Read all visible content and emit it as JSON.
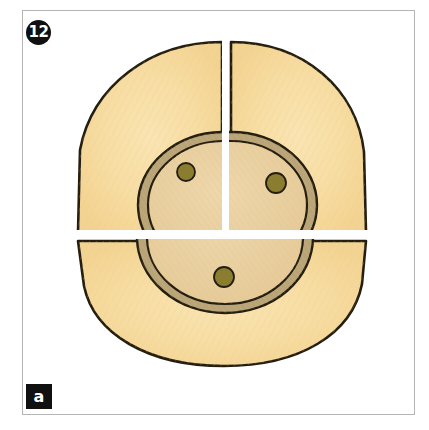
{
  "figure": {
    "panel_number": "12",
    "panel_letter": "a",
    "frame": {
      "x": 22,
      "y": 10,
      "width": 393,
      "height": 405,
      "border_color": "#b5b5b5"
    },
    "background_color": "#ffffff"
  },
  "palette": {
    "outer_cortex_fill": "#f7dda2",
    "inner_core_fill": "#e9cfa0",
    "ring_band_fill": "#b9a477",
    "dot_fill": "#8b7d2f",
    "outline_color": "#241e10",
    "badge_background": "#101010",
    "badge_text": "#ffffff"
  },
  "diagram": {
    "type": "cross-section",
    "segments": [
      {
        "name": "upper-left-segment",
        "label": "upper left quadrant"
      },
      {
        "name": "upper-right-segment",
        "label": "upper right quadrant"
      },
      {
        "name": "lower-segment",
        "label": "lower half"
      }
    ],
    "dots": [
      {
        "name": "dot-upper-left",
        "cx": 186,
        "cy": 172,
        "r": 9
      },
      {
        "name": "dot-upper-right",
        "cx": 276,
        "cy": 183,
        "r": 10
      },
      {
        "name": "dot-lower",
        "cx": 224,
        "cy": 277,
        "r": 10
      }
    ],
    "gaps": {
      "vertical_gap_x": 222,
      "horizontal_gap_y": 234
    }
  }
}
